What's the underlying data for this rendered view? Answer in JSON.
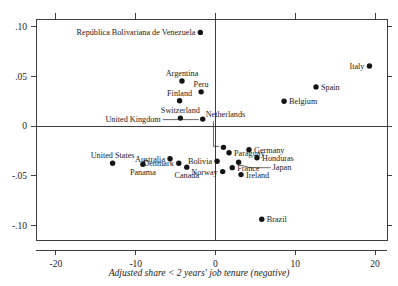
{
  "chart_data": {
    "type": "scatter",
    "title": "",
    "xlabel": "Adjusted share < 2 years' job tenure (negative)",
    "ylabel": "",
    "xlim": [
      -22.5,
      21.5
    ],
    "ylim": [
      -0.115,
      0.108
    ],
    "grid": false,
    "legend": "none",
    "xticks": [
      "-20",
      "-10",
      "0",
      "10",
      "20"
    ],
    "xtick_values": [
      -20,
      -10,
      0,
      10,
      20
    ],
    "yticks": [
      ".10",
      ".05",
      "0",
      "-.05",
      "-.10"
    ],
    "ytick_values": [
      0.1,
      0.05,
      0,
      -0.05,
      -0.1
    ],
    "reference_lines": {
      "horizontal_at_y": 0,
      "vertical_at_x": 0
    },
    "points": [
      {
        "label": "República Bolivariana de Venezuela",
        "x": -1.9,
        "y": 0.0945,
        "label_pos": "left"
      },
      {
        "label": "Italy",
        "x": 19.3,
        "y": 0.0605,
        "label_pos": "left"
      },
      {
        "label": "Argentina",
        "x": -4.2,
        "y": 0.0455,
        "label_pos": "above"
      },
      {
        "label": "Spain",
        "x": 12.6,
        "y": 0.0395,
        "label_pos": "right"
      },
      {
        "label": "Peru",
        "x": -1.8,
        "y": 0.0345,
        "label_pos": "above"
      },
      {
        "label": "Finland",
        "x": -4.5,
        "y": 0.0255,
        "label_pos": "above"
      },
      {
        "label": "Belgium",
        "x": 8.6,
        "y": 0.025,
        "label_pos": "right"
      },
      {
        "label": "Switzerland",
        "x": -4.4,
        "y": 0.008,
        "label_pos": "above"
      },
      {
        "label": "United Kingdom",
        "x": -1.6,
        "y": 0.007,
        "label_pos": "leader-left"
      },
      {
        "label": "Netherlands",
        "x": 1.0,
        "y": -0.0215,
        "label_pos": "leader-above"
      },
      {
        "label": "Germany",
        "x": 4.2,
        "y": -0.024,
        "label_pos": "right"
      },
      {
        "label": "Paraguay",
        "x": 1.7,
        "y": -0.027,
        "label_pos": "right"
      },
      {
        "label": "Honduras",
        "x": 5.2,
        "y": -0.032,
        "label_pos": "right"
      },
      {
        "label": "Bolivia",
        "x": 0.2,
        "y": -0.0355,
        "label_pos": "left"
      },
      {
        "label": "Australia",
        "x": -5.7,
        "y": -0.033,
        "label_pos": "left"
      },
      {
        "label": "Denmark",
        "x": -4.6,
        "y": -0.0375,
        "label_pos": "left"
      },
      {
        "label": "Panama",
        "x": -9.1,
        "y": -0.0385,
        "label_pos": "below"
      },
      {
        "label": "United States",
        "x": -12.9,
        "y": -0.0375,
        "label_pos": "above"
      },
      {
        "label": "Canada",
        "x": -3.6,
        "y": -0.0415,
        "label_pos": "below"
      },
      {
        "label": "Japan",
        "x": 2.9,
        "y": -0.0365,
        "label_pos": "leader-right"
      },
      {
        "label": "France",
        "x": 2.1,
        "y": -0.042,
        "label_pos": "right"
      },
      {
        "label": "Norway",
        "x": 0.9,
        "y": -0.046,
        "label_pos": "left"
      },
      {
        "label": "Ireland",
        "x": 3.2,
        "y": -0.049,
        "label_pos": "right"
      },
      {
        "label": "Brazil",
        "x": 5.8,
        "y": -0.094,
        "label_pos": "right"
      }
    ]
  },
  "clipped_top_text": ""
}
